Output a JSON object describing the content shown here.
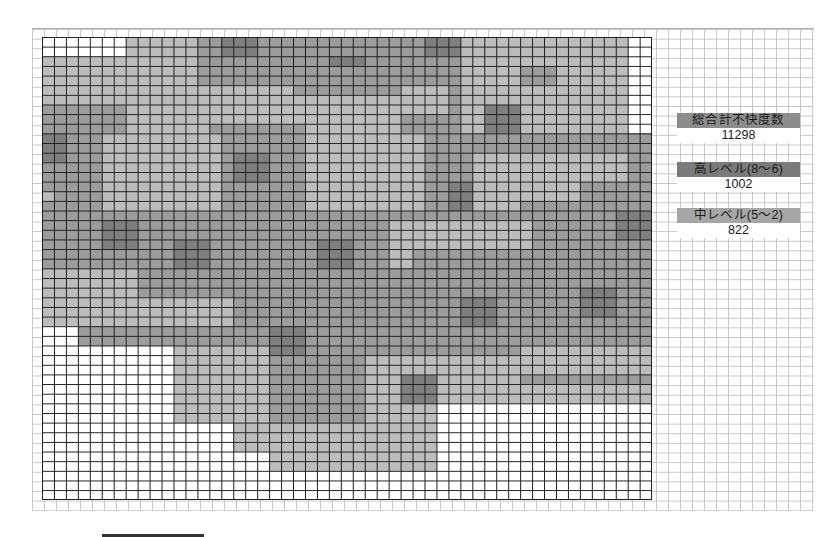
{
  "stats": [
    {
      "label": "総合計不快度数",
      "value": "11298",
      "label_bg": "#8c8c8c"
    },
    {
      "label": "高レベル(8〜6)",
      "value": "1002",
      "label_bg": "#7a7a7a"
    },
    {
      "label": "中レベル(5〜2)",
      "value": "822",
      "label_bg": "#a6a6a6"
    }
  ],
  "chart_data": {
    "type": "heatmap",
    "title": "",
    "grid": {
      "cols": 51,
      "rows": 48
    },
    "levels": [
      {
        "level": 0,
        "color": "#ffffff"
      },
      {
        "level": 1,
        "color": "#bcbcbc"
      },
      {
        "level": 2,
        "color": "#9c9c9c"
      },
      {
        "level": 3,
        "color": "#7f7f7f"
      },
      {
        "level": 4,
        "color": "#5c5c5c"
      }
    ],
    "base_level": 2,
    "zones": [
      {
        "c": 0,
        "r": 0,
        "w": 7,
        "h": 2,
        "v": 0
      },
      {
        "c": 0,
        "r": 2,
        "w": 7,
        "h": 5,
        "v": 1
      },
      {
        "c": 7,
        "r": 0,
        "w": 6,
        "h": 5,
        "v": 1
      },
      {
        "c": 13,
        "r": 0,
        "w": 12,
        "h": 3,
        "v": 2
      },
      {
        "c": 15,
        "r": 0,
        "w": 3,
        "h": 2,
        "v": 3
      },
      {
        "c": 25,
        "r": 0,
        "w": 10,
        "h": 3,
        "v": 2
      },
      {
        "c": 32,
        "r": 0,
        "w": 3,
        "h": 2,
        "v": 3
      },
      {
        "c": 35,
        "r": 0,
        "w": 14,
        "h": 10,
        "v": 1
      },
      {
        "c": 49,
        "r": 0,
        "w": 2,
        "h": 10,
        "v": 0
      },
      {
        "c": 24,
        "r": 2,
        "w": 3,
        "h": 3,
        "v": 3
      },
      {
        "c": 13,
        "r": 3,
        "w": 9,
        "h": 2,
        "v": 2
      },
      {
        "c": 22,
        "r": 3,
        "w": 9,
        "h": 3,
        "v": 2
      },
      {
        "c": 40,
        "r": 3,
        "w": 3,
        "h": 2,
        "v": 2
      },
      {
        "c": 7,
        "r": 5,
        "w": 7,
        "h": 5,
        "v": 1
      },
      {
        "c": 14,
        "r": 5,
        "w": 7,
        "h": 4,
        "v": 1
      },
      {
        "c": 30,
        "r": 5,
        "w": 4,
        "h": 3,
        "v": 1
      },
      {
        "c": 0,
        "r": 7,
        "w": 5,
        "h": 3,
        "v": 2
      },
      {
        "c": 37,
        "r": 7,
        "w": 3,
        "h": 3,
        "v": 3
      },
      {
        "c": 20,
        "r": 6,
        "w": 10,
        "h": 4,
        "v": 1
      },
      {
        "c": 0,
        "r": 10,
        "w": 2,
        "h": 3,
        "v": 3
      },
      {
        "c": 5,
        "r": 10,
        "w": 10,
        "h": 8,
        "v": 1
      },
      {
        "c": 15,
        "r": 9,
        "w": 7,
        "h": 9,
        "v": 2
      },
      {
        "c": 16,
        "r": 12,
        "w": 3,
        "h": 3,
        "v": 3
      },
      {
        "c": 22,
        "r": 10,
        "w": 10,
        "h": 8,
        "v": 1
      },
      {
        "c": 32,
        "r": 10,
        "w": 4,
        "h": 5,
        "v": 2
      },
      {
        "c": 34,
        "r": 15,
        "w": 3,
        "h": 3,
        "v": 3
      },
      {
        "c": 36,
        "r": 12,
        "w": 4,
        "h": 6,
        "v": 1
      },
      {
        "c": 40,
        "r": 12,
        "w": 9,
        "h": 5,
        "v": 1
      },
      {
        "c": 45,
        "r": 15,
        "w": 6,
        "h": 5,
        "v": 2
      },
      {
        "c": 48,
        "r": 18,
        "w": 3,
        "h": 3,
        "v": 3
      },
      {
        "c": 0,
        "r": 16,
        "w": 1,
        "h": 1,
        "v": 1
      },
      {
        "c": 10,
        "r": 17,
        "w": 4,
        "h": 1,
        "v": 1
      },
      {
        "c": 5,
        "r": 19,
        "w": 3,
        "h": 3,
        "v": 3
      },
      {
        "c": 11,
        "r": 21,
        "w": 3,
        "h": 3,
        "v": 3
      },
      {
        "c": 23,
        "r": 21,
        "w": 3,
        "h": 3,
        "v": 3
      },
      {
        "c": 29,
        "r": 19,
        "w": 12,
        "h": 3,
        "v": 1
      },
      {
        "c": 29,
        "r": 22,
        "w": 2,
        "h": 2,
        "v": 1
      },
      {
        "c": 0,
        "r": 24,
        "w": 8,
        "h": 3,
        "v": 1
      },
      {
        "c": 0,
        "r": 27,
        "w": 16,
        "h": 3,
        "v": 1
      },
      {
        "c": 0,
        "r": 30,
        "w": 3,
        "h": 2,
        "v": 0
      },
      {
        "c": 0,
        "r": 32,
        "w": 11,
        "h": 16,
        "v": 0
      },
      {
        "c": 11,
        "r": 32,
        "w": 8,
        "h": 16,
        "v": 1
      },
      {
        "c": 11,
        "r": 40,
        "w": 5,
        "h": 8,
        "v": 0
      },
      {
        "c": 16,
        "r": 40,
        "w": 3,
        "h": 3,
        "v": 1
      },
      {
        "c": 16,
        "r": 43,
        "w": 3,
        "h": 5,
        "v": 0
      },
      {
        "c": 19,
        "r": 30,
        "w": 3,
        "h": 3,
        "v": 3
      },
      {
        "c": 35,
        "r": 27,
        "w": 3,
        "h": 3,
        "v": 3
      },
      {
        "c": 45,
        "r": 26,
        "w": 3,
        "h": 3,
        "v": 3
      },
      {
        "c": 40,
        "r": 32,
        "w": 11,
        "h": 3,
        "v": 1
      },
      {
        "c": 27,
        "r": 33,
        "w": 13,
        "h": 11,
        "v": 1
      },
      {
        "c": 30,
        "r": 35,
        "w": 3,
        "h": 3,
        "v": 3
      },
      {
        "c": 33,
        "r": 38,
        "w": 18,
        "h": 10,
        "v": 0
      },
      {
        "c": 40,
        "r": 36,
        "w": 11,
        "h": 2,
        "v": 1
      },
      {
        "c": 19,
        "r": 40,
        "w": 14,
        "h": 5,
        "v": 1
      },
      {
        "c": 19,
        "r": 45,
        "w": 14,
        "h": 3,
        "v": 0
      }
    ]
  },
  "scale_bar": {
    "visible": true
  }
}
